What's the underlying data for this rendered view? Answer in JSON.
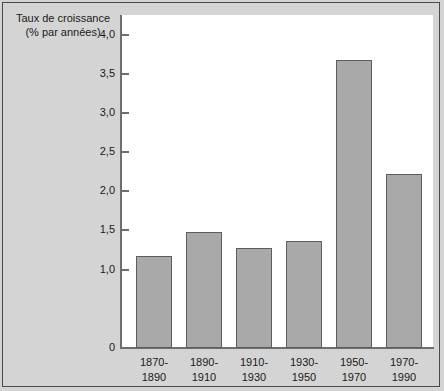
{
  "chart_data": {
    "type": "bar",
    "title": "Taux de croissance (% par années)",
    "title_line1": "Taux de croissance",
    "title_line2": "(% par années)",
    "xlabel": "",
    "ylabel": "Taux de croissance (% par années)",
    "categories": [
      "1870-1890",
      "1890-1910",
      "1910-1930",
      "1930-1950",
      "1950-1970",
      "1970-1990"
    ],
    "category_lines": [
      [
        "1870-",
        "1890"
      ],
      [
        "1890-",
        "1910"
      ],
      [
        "1910-",
        "1930"
      ],
      [
        "1930-",
        "1950"
      ],
      [
        "1950-",
        "1970"
      ],
      [
        "1970-",
        "1990"
      ]
    ],
    "values": [
      1.18,
      1.48,
      1.28,
      1.37,
      3.67,
      2.22
    ],
    "ylim": [
      0,
      4.25
    ],
    "yticks": [
      0,
      1.0,
      1.5,
      2.0,
      2.5,
      3.0,
      3.5,
      4.0
    ],
    "ytick_labels": [
      "0",
      "1,0",
      "1,5",
      "2,0",
      "2,5",
      "3,0",
      "3,5",
      "4,0"
    ],
    "grid": false,
    "legend": false,
    "bar_color": "#a9a9a9",
    "bar_edge_color": "#5d5d5d",
    "plot_background": "#ffffff",
    "figure_background": "#d4d4d4",
    "axis_color": "#6f6f6f"
  }
}
